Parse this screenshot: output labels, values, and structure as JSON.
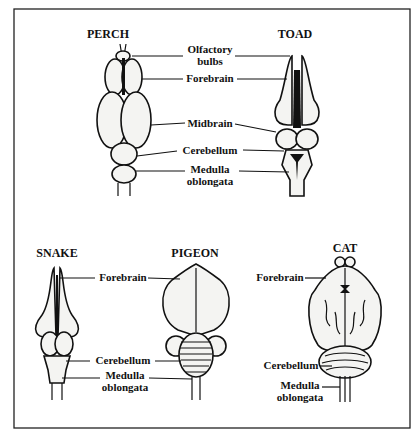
{
  "figure": {
    "top_panel": {
      "animals": [
        {
          "name": "PERCH"
        },
        {
          "name": "TOAD"
        }
      ],
      "shared_labels": [
        {
          "line1": "Olfactory",
          "line2": "bulbs"
        },
        {
          "line1": "Forebrain"
        },
        {
          "line1": "Midbrain"
        },
        {
          "line1": "Cerebellum"
        },
        {
          "line1": "Medulla",
          "line2": "oblongata"
        }
      ]
    },
    "bottom_panel": {
      "snake_pigeon": {
        "animals": [
          {
            "name": "SNAKE"
          },
          {
            "name": "PIGEON"
          }
        ],
        "labels": [
          {
            "line1": "Forebrain"
          },
          {
            "line1": "Cerebellum"
          },
          {
            "line1": "Medulla",
            "line2": "oblongata"
          }
        ]
      },
      "cat": {
        "name": "CAT",
        "labels": [
          {
            "line1": "Forebrain"
          },
          {
            "line1": "Cerebellum"
          },
          {
            "line1": "Medulla",
            "line2": "oblongata"
          }
        ]
      }
    }
  }
}
